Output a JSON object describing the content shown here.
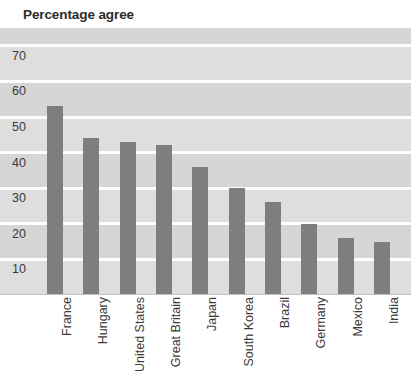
{
  "chart_data": {
    "type": "bar",
    "title": "Percentage agree",
    "xlabel": "",
    "ylabel": "",
    "categories": [
      "France",
      "Hungary",
      "United States",
      "Great Britain",
      "Japan",
      "South Korea",
      "Brazil",
      "Germany",
      "Mexico",
      "India"
    ],
    "values": [
      53,
      44,
      43,
      42,
      36,
      30,
      26,
      20,
      16,
      15
    ],
    "ylim": [
      0,
      75
    ],
    "yticks": [
      70,
      60,
      50,
      40,
      30,
      20,
      10
    ],
    "ytick_labels": [
      "70",
      "60",
      "50",
      "40",
      "30",
      "20",
      "10"
    ],
    "grid": true,
    "legend": false,
    "bar_color": "#7e7e7e",
    "plot_background": "#d9d9d9",
    "gridline_color": "#ffffff",
    "text_color": "#3a3a3a"
  },
  "chart": {
    "title": "Percentage agree"
  }
}
